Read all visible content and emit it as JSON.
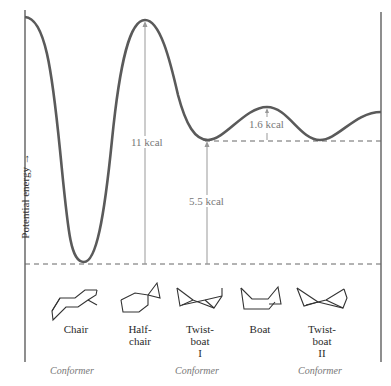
{
  "diagram": {
    "type": "potential-energy-profile",
    "y_axis_label": "Potential energy",
    "y_axis_arrow": "→",
    "energy_labels": {
      "barrier_chair_to_halfchair": "11 kcal",
      "twistboat_above_chair": "5.5 kcal",
      "boat_above_twistboat": "1.6 kcal"
    },
    "conformations": [
      {
        "name": "Chair",
        "line1": "Chair",
        "line2": "",
        "line3": ""
      },
      {
        "name": "Half-chair",
        "line1": "Half-",
        "line2": "chair",
        "line3": ""
      },
      {
        "name": "Twist-boat I",
        "line1": "Twist-",
        "line2": "boat",
        "line3": "I"
      },
      {
        "name": "Boat",
        "line1": "Boat",
        "line2": "",
        "line3": ""
      },
      {
        "name": "Twist-boat II",
        "line1": "Twist-",
        "line2": "boat",
        "line3": "II"
      }
    ],
    "conformer_tags": [
      "Conformer",
      "Conformer",
      "Conformer"
    ],
    "colors": {
      "curve": "#555555",
      "guides": "#999999",
      "text": "#2a2a2a",
      "muted": "#777777"
    }
  }
}
